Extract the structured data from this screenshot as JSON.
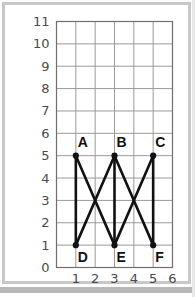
{
  "page": {
    "kind": "scanned-worksheet",
    "frame_color": "#c8c8c8",
    "background_color": "#ffffff",
    "bottom_bar_color": "#b9b9b9"
  },
  "chart_data": {
    "type": "scatter",
    "title": "",
    "xlabel": "",
    "ylabel": "",
    "xlim": [
      0,
      6
    ],
    "ylim": [
      0,
      11
    ],
    "grid": true,
    "grid_color": "#9a9a9a",
    "legend_position": "none",
    "x_ticks": [
      "1",
      "2",
      "3",
      "4",
      "5",
      "6"
    ],
    "x_tick_values": [
      1,
      2,
      3,
      4,
      5,
      6
    ],
    "y_ticks": [
      "0",
      "1",
      "2",
      "3",
      "4",
      "5",
      "6",
      "7",
      "8",
      "9",
      "10",
      "11"
    ],
    "y_tick_values": [
      0,
      1,
      2,
      3,
      4,
      5,
      6,
      7,
      8,
      9,
      10,
      11
    ],
    "series": [
      {
        "name": "labeled-points",
        "color": "#111111",
        "marker": "filled-circle",
        "points": [
          {
            "label": "A",
            "x": 1,
            "y": 5,
            "label_position": "above-left"
          },
          {
            "label": "B",
            "x": 3,
            "y": 5,
            "label_position": "above-left"
          },
          {
            "label": "C",
            "x": 5,
            "y": 5,
            "label_position": "above-left"
          },
          {
            "label": "D",
            "x": 1,
            "y": 1,
            "label_position": "below-left"
          },
          {
            "label": "E",
            "x": 3,
            "y": 1,
            "label_position": "below-left"
          },
          {
            "label": "F",
            "x": 5,
            "y": 1,
            "label_position": "below-left"
          }
        ]
      },
      {
        "name": "segments",
        "color": "#111111",
        "line_width": 2.6,
        "edges": [
          {
            "from": "A",
            "to": "D",
            "x1": 1,
            "y1": 5,
            "x2": 1,
            "y2": 1,
            "kind": "vertical"
          },
          {
            "from": "B",
            "to": "E",
            "x1": 3,
            "y1": 5,
            "x2": 3,
            "y2": 1,
            "kind": "vertical"
          },
          {
            "from": "C",
            "to": "F",
            "x1": 5,
            "y1": 5,
            "x2": 5,
            "y2": 1,
            "kind": "vertical"
          },
          {
            "from": "A",
            "to": "E",
            "x1": 1,
            "y1": 5,
            "x2": 3,
            "y2": 1,
            "kind": "diagonal"
          },
          {
            "from": "D",
            "to": "B",
            "x1": 1,
            "y1": 1,
            "x2": 3,
            "y2": 5,
            "kind": "diagonal"
          },
          {
            "from": "B",
            "to": "F",
            "x1": 3,
            "y1": 5,
            "x2": 5,
            "y2": 1,
            "kind": "diagonal"
          },
          {
            "from": "E",
            "to": "C",
            "x1": 3,
            "y1": 1,
            "x2": 5,
            "y2": 5,
            "kind": "diagonal"
          }
        ]
      }
    ],
    "crossings": [
      {
        "x": 2,
        "y": 3
      },
      {
        "x": 4,
        "y": 3
      }
    ]
  }
}
